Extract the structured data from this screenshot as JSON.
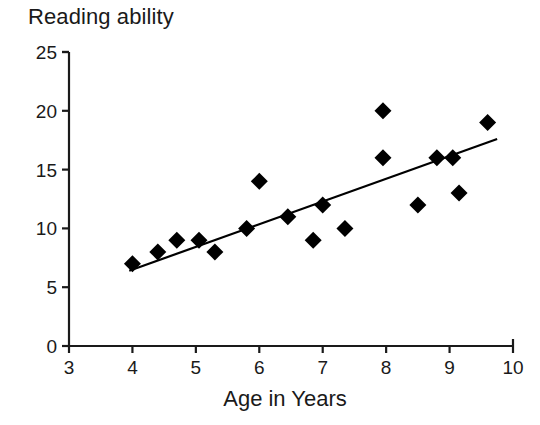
{
  "chart_data": {
    "type": "scatter",
    "title": "",
    "ylabel": "Reading ability",
    "xlabel": "Age in Years",
    "xlim": [
      3,
      10
    ],
    "ylim": [
      0,
      25
    ],
    "xticks": [
      "3",
      "4",
      "5",
      "6",
      "7",
      "8",
      "9",
      "10"
    ],
    "yticks": [
      "0",
      "5",
      "10",
      "15",
      "20",
      "25"
    ],
    "grid": false,
    "legend": "none",
    "marker": "diamond",
    "marker_color": "#000000",
    "line_color": "#000000",
    "points": [
      {
        "x": 4.0,
        "y": 7
      },
      {
        "x": 4.4,
        "y": 8
      },
      {
        "x": 4.7,
        "y": 9
      },
      {
        "x": 5.05,
        "y": 9
      },
      {
        "x": 5.3,
        "y": 8
      },
      {
        "x": 5.8,
        "y": 10
      },
      {
        "x": 6.0,
        "y": 14
      },
      {
        "x": 6.45,
        "y": 11
      },
      {
        "x": 6.85,
        "y": 9
      },
      {
        "x": 7.0,
        "y": 12
      },
      {
        "x": 7.35,
        "y": 10
      },
      {
        "x": 7.95,
        "y": 20
      },
      {
        "x": 7.95,
        "y": 16
      },
      {
        "x": 8.5,
        "y": 12
      },
      {
        "x": 8.8,
        "y": 16
      },
      {
        "x": 9.05,
        "y": 16
      },
      {
        "x": 9.15,
        "y": 13
      },
      {
        "x": 9.6,
        "y": 19
      }
    ],
    "trendline": {
      "x0": 3.95,
      "y0": 6.4,
      "x1": 9.75,
      "y1": 17.6
    }
  }
}
